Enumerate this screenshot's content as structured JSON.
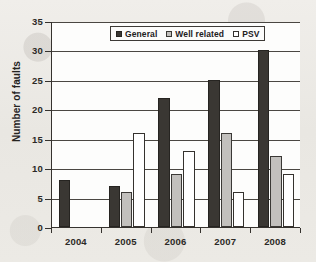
{
  "chart_data": {
    "type": "bar",
    "title": "",
    "xlabel": "",
    "ylabel": "Number of faults",
    "categories": [
      "2004",
      "2005",
      "2006",
      "2007",
      "2008"
    ],
    "series": [
      {
        "name": "General",
        "values": [
          8,
          7,
          22,
          25,
          30
        ],
        "color": "#3a3733"
      },
      {
        "name": "Well related",
        "values": [
          0,
          6,
          9,
          16,
          12
        ],
        "color": "#c2c0bd"
      },
      {
        "name": "PSV",
        "values": [
          0,
          16,
          13,
          6,
          9
        ],
        "color": "#ffffff"
      }
    ],
    "ylim": [
      0,
      35
    ],
    "ytick_values": [
      0,
      5,
      10,
      15,
      20,
      25,
      30,
      35
    ],
    "ytick_labels": [
      "0",
      "5",
      "10",
      "15",
      "20",
      "25",
      "30",
      "35"
    ],
    "grid": "horizontal",
    "legend_position": "top-center"
  },
  "legend": {
    "entries": [
      {
        "label": "General",
        "swatch": "general"
      },
      {
        "label": "Well related",
        "swatch": "well"
      },
      {
        "label": "PSV",
        "swatch": "psv"
      }
    ]
  }
}
